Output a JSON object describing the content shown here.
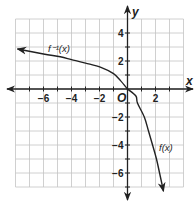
{
  "chart_data": {
    "type": "line",
    "title": "",
    "xlabel": "x",
    "ylabel": "y",
    "xlim": [
      -8,
      4
    ],
    "ylim": [
      -7,
      5
    ],
    "grid": true,
    "origin_label": "O",
    "x_ticks": [
      {
        "value": -6,
        "label": "−6"
      },
      {
        "value": -4,
        "label": "−4"
      },
      {
        "value": -2,
        "label": "−2"
      },
      {
        "value": 2,
        "label": "2"
      }
    ],
    "y_ticks": [
      {
        "value": 4,
        "label": "4"
      },
      {
        "value": 2,
        "label": "2"
      },
      {
        "value": -2,
        "label": "−2"
      },
      {
        "value": -4,
        "label": "−4"
      },
      {
        "value": -6,
        "label": "−6"
      }
    ],
    "series": [
      {
        "name": "f⁻¹(x)",
        "label": "f⁻¹(x)",
        "x": [
          -7.86,
          -6,
          -4.8,
          -4,
          -3,
          -1.9,
          -1,
          -0.5,
          0
        ],
        "y": [
          2.86,
          2.5,
          2.3,
          2.1,
          1.85,
          1.55,
          1.1,
          0.6,
          0
        ]
      },
      {
        "name": "f(x)",
        "label": "f(x)",
        "x": [
          0,
          0.6,
          0.71,
          1.2,
          1.5,
          1.79,
          2.07,
          2.29,
          2.57
        ],
        "y": [
          0,
          -0.5,
          -1,
          -2,
          -3,
          -4,
          -5,
          -6,
          -7.3
        ]
      }
    ]
  }
}
